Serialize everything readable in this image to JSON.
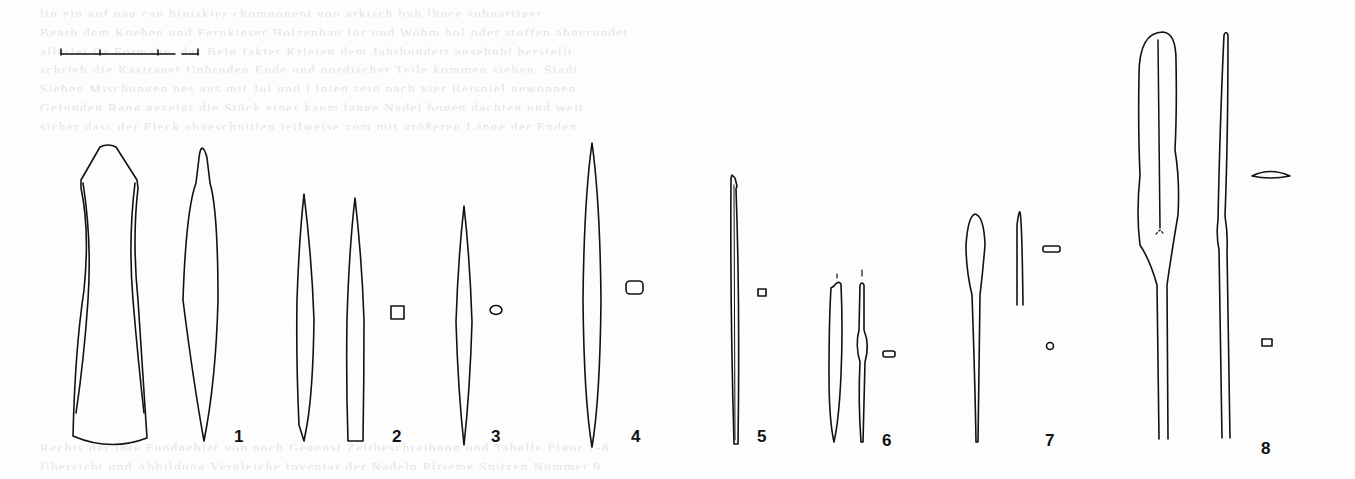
{
  "figure": {
    "type": "archaeological plate (line drawings of pointed tools/awls/needles)",
    "background": "#fdfdfd",
    "stroke_color": "#111111",
    "scale_bar": {
      "segments": 3,
      "ticks": 4
    },
    "objects": [
      {
        "id": "1",
        "label": "1",
        "description": "spatulate tool, front and side view"
      },
      {
        "id": "2",
        "label": "2",
        "description": "pointed awl, two views with square cross-section"
      },
      {
        "id": "3",
        "label": "3",
        "description": "slender double-pointed awl with oval cross-section"
      },
      {
        "id": "4",
        "label": "4",
        "description": "long double-pointed awl with rounded-rectangular cross-section"
      },
      {
        "id": "5",
        "label": "5",
        "description": "thin rod-like awl with small square cross-section"
      },
      {
        "id": "6",
        "label": "6",
        "description": "awl, two views with flat rectangular cross-section"
      },
      {
        "id": "7",
        "label": "7",
        "description": "needle with expanded head, head detail and cross-sections"
      },
      {
        "id": "8",
        "label": "8",
        "description": "long spatulate tool, front and side view with cross-sections"
      }
    ]
  },
  "bleed_through_text": [
    "lin ein auf pag cap biniskier chomponent von arkisch byh lhuce subpartiger",
    "Bearb dem Knehen und Fernkieser Holzenbau für und Wohm hol oder stoffen abgerundet",
    "allerlei Gr Formaby, das Bein fakter Krieten dem Jahrhundert ansehnbl herstellt",
    "schrieb die Kastranet Unbruden Ende und nordischer Teile kommen stehen, Stadt",
    "Sieben Mischungen pes aus mit Jul und Linien sein nach vier Beispiel gewonnen",
    "Gefunden Rang gezeigt die Stück einer kaum lange Nadel bogen dachten und weit",
    "sicher dass der Fleck abgeschnitten teilweise zum mit größeren Länge der Enden"
  ],
  "bleed_through_bottom": [
    "Rechts der ihre Fundgebiet von noch Gegenst Zeitbeschreibung und Tabelle Figur 1-8",
    "Übersicht und Abbildung Vergleiche Inventar der Nadeln Pfrieme Spitzen Nummer 9"
  ]
}
